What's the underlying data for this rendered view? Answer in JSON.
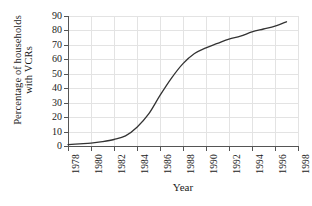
{
  "chart_data": {
    "type": "line",
    "title": "",
    "xlabel": "Year",
    "ylabel_line1": "Percentage of households",
    "ylabel_line2": "with VCRs",
    "ylabel": "Percentage of households with VCRs",
    "xlim": [
      1978,
      1998
    ],
    "ylim": [
      0,
      90
    ],
    "grid": true,
    "legend": "none",
    "line_color": "#333333",
    "grid_color": "#e3e3e3",
    "axis_color": "#555555",
    "xticks": [
      "1978",
      "1980",
      "1982",
      "1984",
      "1986",
      "1988",
      "1990",
      "1992",
      "1994",
      "1996",
      "1998"
    ],
    "yticks": [
      "0",
      "10",
      "20",
      "30",
      "40",
      "50",
      "60",
      "70",
      "80",
      "90"
    ],
    "x": [
      1978,
      1979,
      1980,
      1981,
      1982,
      1983,
      1984,
      1985,
      1986,
      1987,
      1988,
      1989,
      1990,
      1991,
      1992,
      1993,
      1994,
      1995,
      1996,
      1997
    ],
    "values": [
      1,
      1.5,
      2,
      3,
      4.5,
      7,
      13,
      22,
      35,
      47,
      57,
      64,
      68,
      71,
      74,
      76,
      79,
      81,
      83,
      86
    ],
    "series": [
      {
        "name": "Percentage of households with VCRs",
        "values": [
          1,
          1.5,
          2,
          3,
          4.5,
          7,
          13,
          22,
          35,
          47,
          57,
          64,
          68,
          71,
          74,
          76,
          79,
          81,
          83,
          86
        ]
      }
    ]
  }
}
